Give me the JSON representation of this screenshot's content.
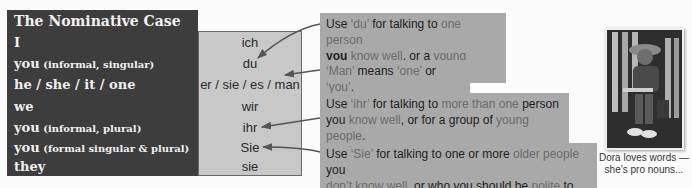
{
  "table": {
    "title": "The Nominative Case",
    "rows": [
      {
        "en": "I",
        "sub": "",
        "de": "ich"
      },
      {
        "en": "you",
        "sub": " (informal, singular)",
        "de": "du"
      },
      {
        "en": "he / she / it / one",
        "sub": "",
        "de": "er / sie / es / man"
      },
      {
        "en": "we",
        "sub": "",
        "de": "wir"
      },
      {
        "en": "you",
        "sub": " (informal, plural)",
        "de": "ihr"
      },
      {
        "en": "you",
        "sub": " (formal singular & plural)",
        "de": "Sie"
      },
      {
        "en": "they",
        "sub": "",
        "de": "sie"
      }
    ]
  },
  "callouts": {
    "du": {
      "p1": "Use ",
      "p2": "‘du’",
      "p3": " for talking to ",
      "p4": "one person",
      "p5": "you",
      "p6": " know well",
      "p7": ", or a ",
      "p8": "young person",
      "p9": "."
    },
    "man": {
      "p1": "‘Man’",
      "p2": " means ",
      "p3": "‘one’",
      "p4": " or ",
      "p5": "‘you’",
      "p6": "."
    },
    "ihr": {
      "p1": "Use ",
      "p2": "‘ihr’",
      "p3": " for talking to ",
      "p4": "more than one",
      "p5": " person",
      "p6": "you ",
      "p7": "know well",
      "p8": ", or for a group of ",
      "p9": "young people",
      "p10": "."
    },
    "sie": {
      "p1": "Use ",
      "p2": "‘Sie’",
      "p3": " for talking to one or more ",
      "p4": "older people",
      "p5": " you",
      "p6": "don’t know well",
      "p7": ", or who you should be ",
      "p8": "polite",
      "p9": " to."
    }
  },
  "photo": {
    "caption_line1": "Dora loves words —",
    "caption_line2": "she’s pro nouns..."
  },
  "colors": {
    "dark_panel": "#3d3d3d",
    "light_panel": "#c8c8c8",
    "callout_bg": "#a9a9a9",
    "highlight_text": "#6b6b6b"
  }
}
